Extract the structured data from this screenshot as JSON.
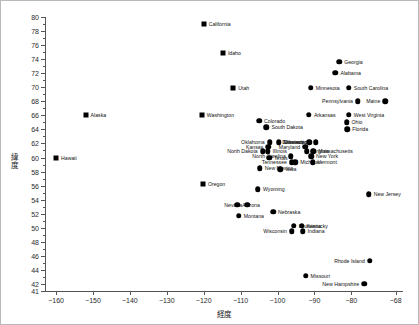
{
  "chart_data": {
    "type": "scatter",
    "title": "",
    "xlabel": "経度",
    "ylabel": "緯度",
    "xlim": [
      -163,
      -66
    ],
    "ylim": [
      41,
      80
    ],
    "grid": false,
    "legend": "none",
    "xticks": [
      -160,
      -150,
      -140,
      -130,
      -120,
      -110,
      -100,
      -90,
      -80,
      -68
    ],
    "xticklabels": [
      "−160",
      "−150",
      "−140",
      "−130",
      "−120",
      "−110",
      "−100",
      "−90",
      "−80",
      "−68"
    ],
    "yticks": [
      41,
      42,
      44,
      46,
      48,
      50,
      52,
      54,
      56,
      58,
      60,
      62,
      64,
      66,
      68,
      70,
      72,
      74,
      76,
      78,
      80
    ],
    "yticklabels": [
      "41",
      "42",
      "44",
      "46",
      "48",
      "50",
      "52",
      "54",
      "56",
      "58",
      "60",
      "62",
      "64",
      "66",
      "68",
      "70",
      "72",
      "74",
      "76",
      "78",
      "80"
    ],
    "marker_color": "#000000",
    "points": [
      {
        "label": "California",
        "x": -120.0,
        "y": 79.0,
        "marker": "square",
        "side": "right"
      },
      {
        "label": "Idaho",
        "x": -114.8,
        "y": 74.9,
        "marker": "square",
        "side": "right"
      },
      {
        "label": "Utah",
        "x": -112.0,
        "y": 69.9,
        "marker": "square",
        "side": "right"
      },
      {
        "label": "Georgia",
        "x": -83.3,
        "y": 73.6,
        "marker": "circle",
        "side": "right"
      },
      {
        "label": "Alabama",
        "x": -84.3,
        "y": 72.1,
        "marker": "circle",
        "side": "right"
      },
      {
        "label": "Minnesota",
        "x": -91.0,
        "y": 69.9,
        "marker": "circle",
        "side": "right"
      },
      {
        "label": "South Carolina",
        "x": -80.7,
        "y": 69.9,
        "marker": "circle",
        "side": "right"
      },
      {
        "label": "Pennsylvania",
        "x": -78.2,
        "y": 68.0,
        "marker": "circle",
        "side": "left"
      },
      {
        "label": "Maine",
        "x": -70.8,
        "y": 68.0,
        "marker": "circle",
        "side": "left"
      },
      {
        "label": "Alaska",
        "x": -152.0,
        "y": 66.0,
        "marker": "square",
        "side": "right"
      },
      {
        "label": "Washington",
        "x": -120.5,
        "y": 66.0,
        "marker": "square",
        "side": "right"
      },
      {
        "label": "Arkansas",
        "x": -91.5,
        "y": 66.1,
        "marker": "circle",
        "side": "right"
      },
      {
        "label": "West Virginia",
        "x": -80.7,
        "y": 66.1,
        "marker": "circle",
        "side": "right"
      },
      {
        "label": "Colorado",
        "x": -105.0,
        "y": 65.2,
        "marker": "circle",
        "side": "right"
      },
      {
        "label": "Ohio",
        "x": -81.3,
        "y": 65.0,
        "marker": "circle",
        "side": "right"
      },
      {
        "label": "South Dakota",
        "x": -103.0,
        "y": 64.3,
        "marker": "circle",
        "side": "right"
      },
      {
        "label": "Florida",
        "x": -81.1,
        "y": 64.0,
        "marker": "circle",
        "side": "right"
      },
      {
        "label": "Oklahoma",
        "x": -102.1,
        "y": 62.2,
        "marker": "circle",
        "side": "left"
      },
      {
        "label": "Mississippi",
        "x": -99.7,
        "y": 62.2,
        "marker": "circle",
        "side": "right"
      },
      {
        "label": "Delaware",
        "x": -91.4,
        "y": 62.2,
        "marker": "circle",
        "side": "left"
      },
      {
        "label": "Connecticut",
        "x": -89.6,
        "y": 62.2,
        "marker": "circle",
        "side": "left"
      },
      {
        "label": "Kansas",
        "x": -102.5,
        "y": 61.5,
        "marker": "circle",
        "side": "left"
      },
      {
        "label": "Maryland",
        "x": -92.5,
        "y": 61.5,
        "marker": "circle",
        "side": "left"
      },
      {
        "label": "North Dakota",
        "x": -104.0,
        "y": 60.9,
        "marker": "circle",
        "side": "left"
      },
      {
        "label": "Illinois",
        "x": -102.7,
        "y": 60.9,
        "marker": "circle",
        "side": "right"
      },
      {
        "label": "Virginia",
        "x": -92.1,
        "y": 60.9,
        "marker": "circle",
        "side": "right"
      },
      {
        "label": "Massachusetts",
        "x": -90.3,
        "y": 60.9,
        "marker": "circle",
        "side": "right"
      },
      {
        "label": "North Carolina",
        "x": -96.4,
        "y": 60.2,
        "marker": "circle",
        "side": "left"
      },
      {
        "label": "New York",
        "x": -90.9,
        "y": 60.2,
        "marker": "circle",
        "side": "right"
      },
      {
        "label": "Texas",
        "x": -102.3,
        "y": 60.0,
        "marker": "circle",
        "side": "right"
      },
      {
        "label": "Michigan",
        "x": -95.2,
        "y": 59.3,
        "marker": "circle",
        "side": "right"
      },
      {
        "label": "Tennessee",
        "x": -96.1,
        "y": 59.3,
        "marker": "circle",
        "side": "left"
      },
      {
        "label": "Vermont",
        "x": -90.5,
        "y": 59.3,
        "marker": "circle",
        "side": "right"
      },
      {
        "label": "Hawaii",
        "x": -160.0,
        "y": 60.0,
        "marker": "square",
        "side": "right"
      },
      {
        "label": "New Mexico",
        "x": -104.8,
        "y": 58.5,
        "marker": "circle",
        "side": "right"
      },
      {
        "label": "Iowa",
        "x": -99.2,
        "y": 58.3,
        "marker": "circle",
        "side": "right"
      },
      {
        "label": "Oregon",
        "x": -120.2,
        "y": 56.2,
        "marker": "square",
        "side": "right"
      },
      {
        "label": "Wyoming",
        "x": -105.3,
        "y": 55.5,
        "marker": "circle",
        "side": "right"
      },
      {
        "label": "New Jersey",
        "x": -75.3,
        "y": 54.8,
        "marker": "circle",
        "side": "right"
      },
      {
        "label": "Nevada",
        "x": -108.2,
        "y": 53.3,
        "marker": "circle",
        "side": "left"
      },
      {
        "label": "Arizona",
        "x": -110.9,
        "y": 53.3,
        "marker": "circle",
        "side": "right"
      },
      {
        "label": "Nebraska",
        "x": -101.2,
        "y": 52.3,
        "marker": "circle",
        "side": "right"
      },
      {
        "label": "Montana",
        "x": -110.5,
        "y": 51.7,
        "marker": "circle",
        "side": "right"
      },
      {
        "label": "Louisiana",
        "x": -95.6,
        "y": 50.3,
        "marker": "circle",
        "side": "right"
      },
      {
        "label": "Kentucky",
        "x": -93.5,
        "y": 50.3,
        "marker": "circle",
        "side": "right"
      },
      {
        "label": "Wisconsin",
        "x": -96.1,
        "y": 49.5,
        "marker": "circle",
        "side": "left"
      },
      {
        "label": "Indiana",
        "x": -93.2,
        "y": 49.5,
        "marker": "circle",
        "side": "right"
      },
      {
        "label": "Rhode Island",
        "x": -75.0,
        "y": 45.3,
        "marker": "circle",
        "side": "left"
      },
      {
        "label": "Missouri",
        "x": -92.4,
        "y": 43.2,
        "marker": "circle",
        "side": "right"
      },
      {
        "label": "New Hampshire",
        "x": -76.5,
        "y": 42.0,
        "marker": "circle",
        "side": "left"
      }
    ]
  }
}
